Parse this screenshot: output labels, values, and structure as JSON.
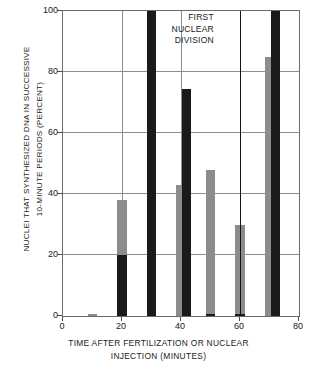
{
  "chart_data": {
    "type": "bar",
    "title": "",
    "subtitle": "",
    "xlabel_lines": [
      "TIME AFTER FERTILIZATION OR NUCLEAR",
      "INJECTION (MINUTES)"
    ],
    "ylabel_lines": [
      "NUCLEI THAT SYNTHESIZED DNA IN SUCCESSIVE",
      "10-MINUTE PERIODS (PERCENT)"
    ],
    "xlim": [
      0,
      80
    ],
    "ylim": [
      0,
      100
    ],
    "xticks": [
      0,
      20,
      40,
      60,
      80
    ],
    "yticks": [
      0,
      20,
      40,
      60,
      80,
      100
    ],
    "grid": true,
    "legend_position": "none",
    "annotations": [
      {
        "name": "first-nuclear-division",
        "lines": [
          "FIRST",
          "NUCLEAR",
          "DIVISION"
        ],
        "x": 60,
        "marker": "vertical-line"
      }
    ],
    "series": [
      {
        "name": "gray",
        "color": "#8c8c8c",
        "x": [
          10,
          20,
          30,
          40,
          50,
          60,
          70
        ],
        "values": [
          0.6,
          38,
          26,
          43,
          48,
          30,
          85
        ]
      },
      {
        "name": "black",
        "color": "#1a1a1a",
        "x": [
          20,
          30,
          42,
          50,
          60,
          72
        ],
        "values": [
          20,
          100,
          74.5,
          0.6,
          0.6,
          100
        ]
      }
    ],
    "bar_width_minutes": 3.1,
    "colors": {
      "gray_series": "#8c8c8c",
      "black_series": "#1a1a1a",
      "grid": "#8d8d8d",
      "frame": "#6a6a6a",
      "divider": "#141414",
      "background": "#ffffff",
      "text": "#1a1a1a"
    }
  }
}
